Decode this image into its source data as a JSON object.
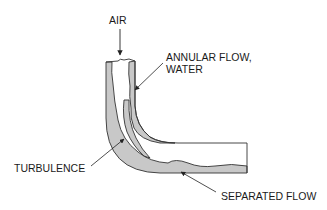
{
  "diagram": {
    "labels": {
      "air": "AIR",
      "annular_line1": "ANNULAR FLOW,",
      "annular_line2": "WATER",
      "turbulence": "TURBULENCE",
      "separated": "SEPARATED FLOW"
    },
    "colors": {
      "water_film": "#c8c8c8",
      "outline": "#333333",
      "background": "#ffffff"
    }
  }
}
